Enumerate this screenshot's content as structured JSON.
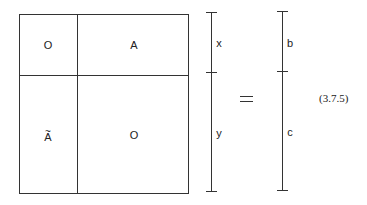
{
  "equation": {
    "number": "(3.7.5)",
    "operator": "=",
    "matrix": {
      "blocks": [
        {
          "position": "top-left",
          "label": "O"
        },
        {
          "position": "top-right",
          "label": "A"
        },
        {
          "position": "bottom-left",
          "label": "A",
          "accent": "~"
        },
        {
          "position": "bottom-right",
          "label": "O"
        }
      ]
    },
    "lhs_vector": {
      "segments": [
        "x",
        "y"
      ]
    },
    "rhs_vector": {
      "segments": [
        "b",
        "c"
      ]
    }
  }
}
